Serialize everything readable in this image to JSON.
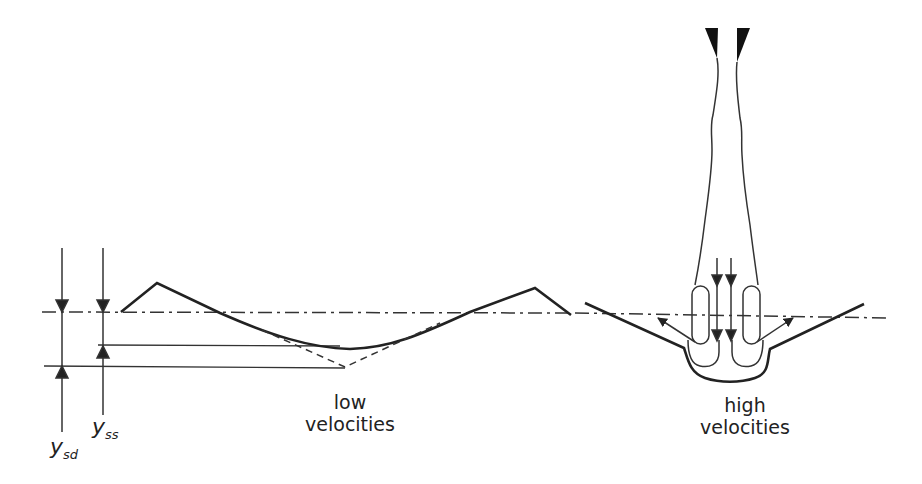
{
  "diagram": {
    "title": "",
    "labels": {
      "low_line1": "low",
      "low_line2": "velocities",
      "high_line1": "high",
      "high_line2": "velocities",
      "ysd_main": "y",
      "ysd_sub": "sd",
      "yss_main": "y",
      "yss_sub": "ss"
    },
    "colors": {
      "stroke": "#222222",
      "background": "#ffffff"
    },
    "elements": [
      "water-surface-dash-dot-line",
      "low-velocity-scour-profile",
      "dashed-static-scour-profile",
      "ysd-dimension",
      "yss-dimension",
      "jet-nozzle",
      "jet-stream",
      "high-velocity-scour-hole",
      "recirculation-vortices",
      "flow-arrows"
    ]
  }
}
